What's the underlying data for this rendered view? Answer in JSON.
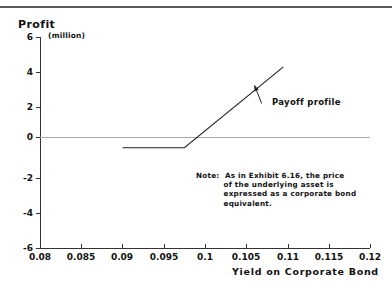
{
  "figure": {
    "y_axis_title": "Profit",
    "y_axis_unit": "(million)",
    "x_axis_title": "Yield on Corporate Bond",
    "series_label": "Payoff profile",
    "note_label": "Note:",
    "note_text": "As in Exhibit 6.16, the price\nof the underlying asset is\nexpressed as a corporate bond\nequivalent.",
    "accent_color": "#222222",
    "zero_line_color": "#aaaaaa"
  },
  "chart_data": {
    "type": "line",
    "title": "",
    "subtitle": "",
    "xlabel": "Yield on Corporate Bond",
    "ylabel": "Profit",
    "ylabel_unit": "(million)",
    "xlim": [
      0.08,
      0.12
    ],
    "ylim": [
      -6,
      6
    ],
    "xticks": [
      0.08,
      0.085,
      0.09,
      0.095,
      0.1,
      0.105,
      0.11,
      0.115,
      0.12
    ],
    "xticklabels": [
      "0.08",
      "0.085",
      "0.09",
      "0.095",
      "0.1",
      "0.105",
      "0.11",
      "0.115",
      "0.12"
    ],
    "yticks": [
      -6,
      -4,
      -2,
      0,
      2,
      4,
      6
    ],
    "yticklabels": [
      "-6",
      "-4",
      "-2",
      "0",
      "2",
      "4",
      "6"
    ],
    "grid": false,
    "legend": false,
    "reference_lines": [
      {
        "type": "horizontal",
        "value": 0,
        "color": "#aaaaaa",
        "from": 0.08,
        "to": 0.12
      }
    ],
    "series": [
      {
        "name": "Payoff profile",
        "color": "#222222",
        "x": [
          0.09,
          0.0975,
          0.1095
        ],
        "y": [
          -0.3,
          -0.3,
          4.3
        ]
      }
    ],
    "annotations": [
      {
        "text": "Payoff profile",
        "x": 0.1076,
        "y": 2.05,
        "leader_from_x": 0.106,
        "leader_from_y": 3.25
      },
      {
        "text": "Note:  As in Exhibit 6.16, the price of the underlying asset is expressed as a corporate bond equivalent.",
        "x": 0.0987,
        "y": -1.1
      }
    ]
  },
  "ticks": {
    "y": [
      {
        "label": "6",
        "top": 37
      },
      {
        "label": "4",
        "top": 72
      },
      {
        "label": "2",
        "top": 107
      },
      {
        "label": "0",
        "top": 137
      },
      {
        "label": "-2",
        "top": 178
      },
      {
        "label": "-4",
        "top": 213
      },
      {
        "label": "-6",
        "top": 248
      }
    ],
    "x": [
      {
        "label": "0.08",
        "left": 40
      },
      {
        "label": "0.085",
        "left": 81
      },
      {
        "label": "0.09",
        "left": 122
      },
      {
        "label": "0.095",
        "left": 164
      },
      {
        "label": "0.1",
        "left": 205
      },
      {
        "label": "0.105",
        "left": 246
      },
      {
        "label": "0.11",
        "left": 288
      },
      {
        "label": "0.115",
        "left": 329
      },
      {
        "label": "0.12",
        "left": 370
      }
    ]
  }
}
